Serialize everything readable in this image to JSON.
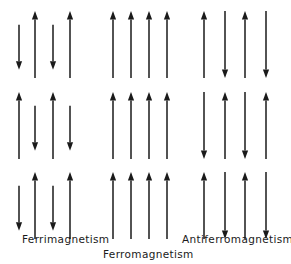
{
  "figure": {
    "width": 291,
    "height": 264,
    "background_color": "#ffffff",
    "arrow_color": "#1a1a1a",
    "text_color": "#1a1a1a"
  },
  "labels": {
    "ferrimagnetism": "Ferrimagnetism",
    "ferromagnetism": "Ferromagnetism",
    "antiferromagnetism": "Antiferromagnetism"
  },
  "diagram_data": {
    "type": "spin-lattice-diagram",
    "description": "Three 3-row by 4-column arrays of vertical arrows illustrating types of magnetic ordering.",
    "row_tops": [
      11,
      92,
      172
    ],
    "long_arrow_length": 67,
    "short_arrow_length": 45,
    "groups": [
      {
        "name": "ferrimagnetism",
        "label": "Ferrimagnetism",
        "column_x": [
          19,
          35,
          53,
          70
        ],
        "rows": [
          [
            {
              "direction": "down",
              "length": "short"
            },
            {
              "direction": "up",
              "length": "long"
            },
            {
              "direction": "down",
              "length": "short"
            },
            {
              "direction": "up",
              "length": "long"
            }
          ],
          [
            {
              "direction": "up",
              "length": "long"
            },
            {
              "direction": "down",
              "length": "short"
            },
            {
              "direction": "up",
              "length": "long"
            },
            {
              "direction": "down",
              "length": "short"
            }
          ],
          [
            {
              "direction": "down",
              "length": "short"
            },
            {
              "direction": "up",
              "length": "long"
            },
            {
              "direction": "down",
              "length": "short"
            },
            {
              "direction": "up",
              "length": "long"
            }
          ]
        ]
      },
      {
        "name": "ferromagnetism",
        "label": "Ferromagnetism",
        "column_x": [
          113,
          131,
          149,
          167
        ],
        "rows": [
          [
            {
              "direction": "up",
              "length": "long"
            },
            {
              "direction": "up",
              "length": "long"
            },
            {
              "direction": "up",
              "length": "long"
            },
            {
              "direction": "up",
              "length": "long"
            }
          ],
          [
            {
              "direction": "up",
              "length": "long"
            },
            {
              "direction": "up",
              "length": "long"
            },
            {
              "direction": "up",
              "length": "long"
            },
            {
              "direction": "up",
              "length": "long"
            }
          ],
          [
            {
              "direction": "up",
              "length": "long"
            },
            {
              "direction": "up",
              "length": "long"
            },
            {
              "direction": "up",
              "length": "long"
            },
            {
              "direction": "up",
              "length": "long"
            }
          ]
        ]
      },
      {
        "name": "antiferromagnetism",
        "label": "Antiferromagnetism",
        "column_x": [
          204,
          225,
          245,
          266
        ],
        "rows": [
          [
            {
              "direction": "up",
              "length": "long"
            },
            {
              "direction": "down",
              "length": "long"
            },
            {
              "direction": "up",
              "length": "long"
            },
            {
              "direction": "down",
              "length": "long"
            }
          ],
          [
            {
              "direction": "down",
              "length": "long"
            },
            {
              "direction": "up",
              "length": "long"
            },
            {
              "direction": "down",
              "length": "long"
            },
            {
              "direction": "up",
              "length": "long"
            }
          ],
          [
            {
              "direction": "up",
              "length": "long"
            },
            {
              "direction": "down",
              "length": "long"
            },
            {
              "direction": "up",
              "length": "long"
            },
            {
              "direction": "down",
              "length": "long"
            }
          ]
        ]
      }
    ]
  }
}
